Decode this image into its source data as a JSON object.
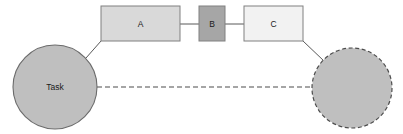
{
  "diagram": {
    "canvas": {
      "width": 403,
      "height": 134,
      "background": "#ffffff"
    },
    "nodes": {
      "task_circle": {
        "label": "Task",
        "shape": "circle",
        "cx": 55,
        "cy": 87,
        "r": 42,
        "fill": "#bfbfbf",
        "stroke": "#6b6b6b",
        "stroke_style": "solid"
      },
      "box_a": {
        "label": "A",
        "shape": "rect",
        "x": 101,
        "y": 6,
        "width": 79,
        "height": 35,
        "fill": "#d9d9d9",
        "stroke": "#808080",
        "stroke_style": "solid"
      },
      "box_b": {
        "label": "B",
        "shape": "rect",
        "x": 199,
        "y": 6,
        "width": 26,
        "height": 35,
        "fill": "#a6a6a6",
        "stroke": "#808080",
        "stroke_style": "solid"
      },
      "box_c": {
        "label": "C",
        "shape": "rect",
        "x": 244,
        "y": 6,
        "width": 59,
        "height": 35,
        "fill": "#f2f2f2",
        "stroke": "#808080",
        "stroke_style": "solid"
      },
      "dashed_circle": {
        "label": "",
        "shape": "circle",
        "cx": 352,
        "cy": 88,
        "r": 40,
        "fill": "#bfbfbf",
        "stroke": "#4d4d4d",
        "stroke_style": "dashed"
      }
    },
    "connectors": {
      "task_to_a": {
        "from": "task_circle",
        "to": "box_a",
        "style": "solid",
        "stroke": "#595959",
        "x1": 86,
        "y1": 58,
        "x2": 101,
        "y2": 41
      },
      "a_to_b": {
        "from": "box_a",
        "to": "box_b",
        "style": "solid",
        "stroke": "#595959",
        "x1": 180,
        "y1": 24,
        "x2": 199,
        "y2": 24
      },
      "b_to_c": {
        "from": "box_b",
        "to": "box_c",
        "style": "solid",
        "stroke": "#595959",
        "x1": 225,
        "y1": 24,
        "x2": 244,
        "y2": 24
      },
      "c_to_dashed_circle": {
        "from": "box_c",
        "to": "dashed_circle",
        "style": "solid",
        "stroke": "#595959",
        "x1": 303,
        "y1": 41,
        "x2": 323,
        "y2": 60
      },
      "task_to_dashed_circle": {
        "from": "task_circle",
        "to": "dashed_circle",
        "style": "dashed",
        "stroke": "#4d4d4d",
        "x1": 97,
        "y1": 87,
        "x2": 312,
        "y2": 87
      }
    }
  }
}
